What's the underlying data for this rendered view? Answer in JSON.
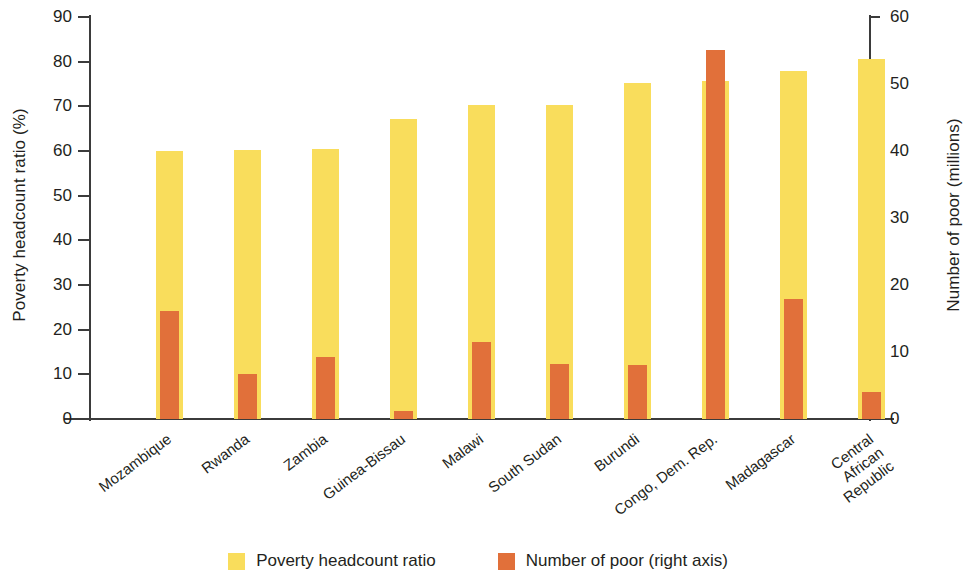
{
  "chart_data": {
    "type": "bar",
    "title": "",
    "subtitle": "",
    "xlabel": "",
    "ylabel": "Poverty headcount ratio (%)",
    "y2label": "Number of poor (millions)",
    "grid": false,
    "legend_position": "bottom",
    "ylim": [
      0,
      90
    ],
    "y2lim": [
      0,
      60
    ],
    "yticks": [
      0,
      10,
      20,
      30,
      40,
      50,
      60,
      70,
      80,
      90
    ],
    "y2ticks": [
      0,
      10,
      20,
      30,
      40,
      50,
      60
    ],
    "ytick_labels": [
      "0",
      "10",
      "20",
      "30",
      "40",
      "50",
      "60",
      "70",
      "80",
      "90"
    ],
    "y2tick_labels": [
      "0",
      "10",
      "20",
      "30",
      "40",
      "50",
      "60"
    ],
    "categories": [
      "Mozambique",
      "Rwanda",
      "Zambia",
      "Guinea-Bissau",
      "Malawi",
      "South Sudan",
      "Burundi",
      "Congo, Dem. Rep.",
      "Madagascar",
      "Central African Republic"
    ],
    "series": [
      {
        "name": "Poverty headcount ratio",
        "axis": "left",
        "unit": "%",
        "color": "#f9dd5c",
        "values": [
          60.0,
          60.3,
          60.5,
          67.1,
          70.3,
          70.4,
          75.2,
          75.6,
          77.9,
          80.7
        ]
      },
      {
        "name": "Number of poor (right axis)",
        "axis": "right",
        "unit": "millions",
        "color": "#e1703a",
        "values": [
          16.1,
          6.7,
          9.3,
          1.2,
          11.5,
          8.2,
          8.0,
          55.1,
          17.9,
          4.0
        ]
      }
    ],
    "legend": [
      {
        "label": "Poverty headcount ratio",
        "color": "#f9dd5c"
      },
      {
        "label": "Number of poor (right axis)",
        "color": "#e1703a"
      }
    ]
  },
  "axes": {
    "left_title": "Poverty headcount ratio (%)",
    "right_title": "Number of poor (millions)"
  }
}
